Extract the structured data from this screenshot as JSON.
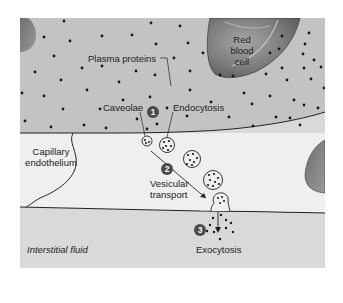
{
  "figure": {
    "labels": {
      "plasma_proteins": "Plasma proteins",
      "red_blood_cell_line1": "Red",
      "red_blood_cell_line2": "blood",
      "red_blood_cell_line3": "cell",
      "caveolae": "Caveolae",
      "endocytosis": "Endocytosis",
      "capillary_endothelium_line1": "Capillary",
      "capillary_endothelium_line2": "endothelium",
      "vesicular_transport_line1": "Vesicular",
      "vesicular_transport_line2": "transport",
      "interstitial_fluid": "Interstitial fluid",
      "exocytosis": "Exocytosis"
    },
    "steps": [
      {
        "number": "1",
        "meaning": "Endocytosis"
      },
      {
        "number": "2",
        "meaning": "Vesicular transport"
      },
      {
        "number": "3",
        "meaning": "Exocytosis"
      }
    ],
    "colors": {
      "plasma": "#c3c3c3",
      "endothelium": "#efefef",
      "interstitial": "#d9d9d9",
      "red_blood_cell": "#7a7a7a",
      "step_badge": "#4a4a4a",
      "protein_dot": "#1a1a1a"
    }
  }
}
